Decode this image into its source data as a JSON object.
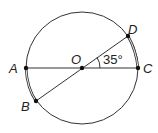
{
  "diagram": {
    "type": "circle-geometry",
    "center": {
      "label": "O",
      "x": 82,
      "y": 68
    },
    "radius": 56,
    "points": [
      {
        "label": "A",
        "x": 26,
        "y": 68
      },
      {
        "label": "B",
        "x": 36,
        "y": 100
      },
      {
        "label": "C",
        "x": 138,
        "y": 68
      },
      {
        "label": "D",
        "x": 128,
        "y": 36
      }
    ],
    "segments": [
      "AC",
      "BD",
      "AB",
      "DC"
    ],
    "angle": {
      "vertex": "O",
      "between": [
        "D",
        "C"
      ],
      "value": "35°"
    }
  }
}
